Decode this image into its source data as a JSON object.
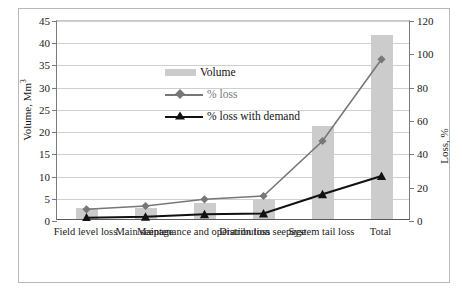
{
  "chart_data": {
    "type": "bar",
    "title": "",
    "subtitle": "",
    "categories": [
      "Field level loss",
      "Main seepage",
      "Maintenance and operation loss",
      "Distribution seepage",
      "System tail loss",
      "Total"
    ],
    "xlabel": "",
    "grid": true,
    "legend_position": "inside-top-left",
    "axes": {
      "left": {
        "label": "Volume, Mm",
        "label_sup": "3",
        "min": 0,
        "max": 45,
        "step": 5,
        "ticks": [
          "0",
          "5",
          "10",
          "15",
          "20",
          "25",
          "30",
          "35",
          "40",
          "45"
        ]
      },
      "right": {
        "label": "Loss, %",
        "min": 0,
        "max": 120,
        "step": 20,
        "ticks": [
          "0",
          "20",
          "40",
          "60",
          "80",
          "100",
          "120"
        ]
      }
    },
    "series": [
      {
        "name": "Volume",
        "kind": "bar",
        "axis": "left",
        "color": "#cccccc",
        "values": [
          2.5,
          2.5,
          3.5,
          4.5,
          21.0,
          41.5
        ]
      },
      {
        "name": "% loss",
        "kind": "line",
        "axis": "right",
        "marker": "diamond",
        "color": "#777777",
        "values": [
          7,
          9,
          13,
          15,
          48,
          97
        ]
      },
      {
        "name": "% loss with demand",
        "kind": "line",
        "axis": "right",
        "marker": "triangle",
        "color": "#111111",
        "values": [
          2,
          2.5,
          4,
          4.5,
          16,
          27
        ]
      }
    ]
  },
  "legend": {
    "items": [
      {
        "label": "Volume"
      },
      {
        "label": "% loss"
      },
      {
        "label": "% loss with demand"
      }
    ]
  }
}
